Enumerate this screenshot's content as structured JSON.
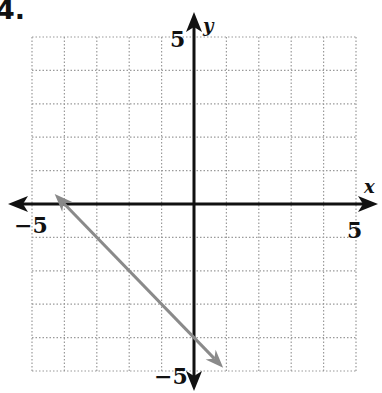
{
  "problem_number": "4.",
  "chart_data": {
    "type": "line",
    "title": "",
    "xlabel": "x",
    "ylabel": "y",
    "xlim": [
      -5,
      5
    ],
    "ylim": [
      -5,
      5
    ],
    "grid": true,
    "grid_style": "dotted",
    "tick_labels": {
      "x_min": "−5",
      "x_max": "5",
      "y_min": "−5",
      "y_max": "5"
    },
    "series": [
      {
        "name": "line",
        "equation": "y = -x - 4",
        "color": "#8a8a8a",
        "arrows": "both",
        "x": [
          -4.3,
          -4,
          0,
          0.9
        ],
        "y": [
          0.3,
          0,
          -4,
          -4.9
        ]
      }
    ]
  },
  "layout": {
    "origin_px": [
      194,
      204
    ],
    "unit_px_x": 32.4,
    "unit_px_y": 33.4,
    "grid_color": "#9a9a9a",
    "axis_color": "#111111"
  }
}
